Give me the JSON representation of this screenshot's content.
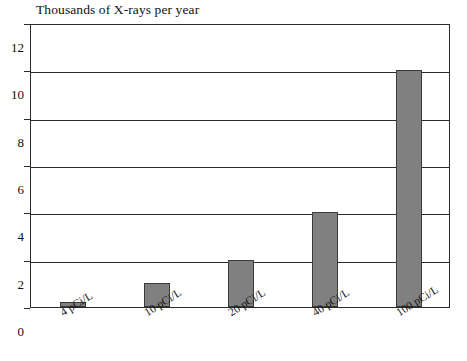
{
  "chart_data": {
    "type": "bar",
    "title": "Thousands of X-rays per year",
    "xlabel": "",
    "ylabel": "",
    "categories": [
      "4 pCi/L",
      "10 pCi/L",
      "20 pCi/L",
      "40 pCi/L",
      "100 pCi/L"
    ],
    "values": [
      0.2,
      1,
      2,
      4,
      10
    ],
    "ylim": [
      0,
      12
    ],
    "yticks": [
      0,
      2,
      4,
      6,
      8,
      10,
      12
    ],
    "ytick_labels": [
      "0",
      "2",
      "4",
      "6",
      "8",
      "10",
      "12"
    ],
    "grid": true,
    "legend": null,
    "bar_color": "#808080",
    "bar_border_color": "#3a3a3a",
    "axis_color": "#2a2a2a",
    "background_color": "#ffffff"
  }
}
